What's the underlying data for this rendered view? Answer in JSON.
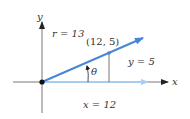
{
  "diagram": {
    "axes": {
      "x_label": "x",
      "y_label": "y"
    },
    "vector": {
      "r_label": "r = 13",
      "point_label": "(12, 5)"
    },
    "legs": {
      "opposite_label": "y = 5",
      "adjacent_label": "x = 12"
    },
    "angle_label": "θ",
    "colors": {
      "vector": "#4a86d6",
      "x_leg": "#a9cdef",
      "axes": "#777777",
      "origin": "#111111"
    }
  }
}
